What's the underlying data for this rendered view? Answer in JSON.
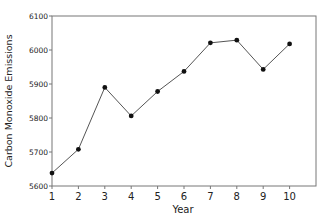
{
  "chart_data": {
    "type": "line",
    "title": "",
    "xlabel": "Year",
    "ylabel": "Carbon Monoxide Emissions",
    "x": [
      1,
      2,
      3,
      4,
      5,
      6,
      7,
      8,
      9,
      10
    ],
    "series": [
      {
        "name": "Carbon Monoxide Emissions",
        "values": [
          5638,
          5708,
          5890,
          5806,
          5878,
          5937,
          6021,
          6029,
          5943,
          6018
        ]
      }
    ],
    "xlim": [
      1,
      11
    ],
    "ylim": [
      5600,
      6100
    ],
    "xticks": [
      1,
      2,
      3,
      4,
      5,
      6,
      7,
      8,
      9,
      10
    ],
    "yticks": [
      5600,
      5700,
      5800,
      5900,
      6000,
      6100
    ],
    "grid": false,
    "legend": null,
    "line_color": "#555555",
    "marker_color": "#111111"
  }
}
